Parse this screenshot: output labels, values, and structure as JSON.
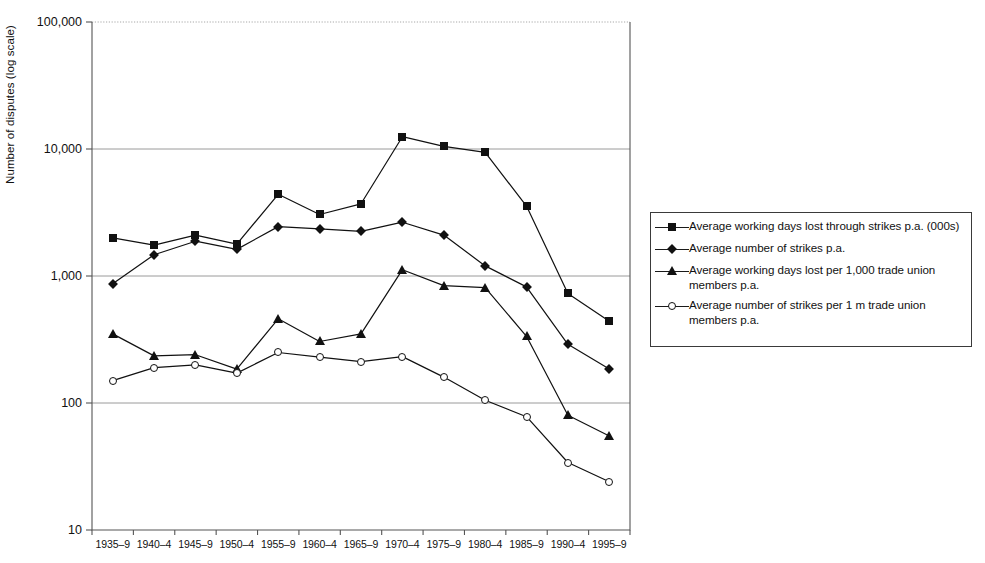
{
  "chart_data": {
    "type": "line",
    "title": "",
    "xlabel": "",
    "ylabel": "Number of disputes (log scale)",
    "log_scale": true,
    "ylim": [
      10,
      100000
    ],
    "ytick_values": [
      100000,
      10000,
      1000,
      100,
      10
    ],
    "ytick_labels": [
      "100,000",
      "10,000",
      "1,000",
      "100",
      "10"
    ],
    "grid": "horizontal-gridlines-at-y-ticks",
    "legend_position": "right-outside",
    "categories": [
      "1935–9",
      "1940–4",
      "1945–9",
      "1950–4",
      "1955–9",
      "1960–4",
      "1965–9",
      "1970–4",
      "1975–9",
      "1980–4",
      "1985–9",
      "1990–4",
      "1995–9"
    ],
    "series": [
      {
        "name": "Average working days lost through strikes p.a. (000s)",
        "marker": "filled-square",
        "values": [
          2000,
          1750,
          2100,
          1780,
          4400,
          3050,
          3700,
          12500,
          10500,
          9400,
          3550,
          730,
          440
        ]
      },
      {
        "name": "Average number of strikes p.a.",
        "marker": "filled-diamond",
        "values": [
          870,
          1470,
          1880,
          1620,
          2450,
          2350,
          2250,
          2650,
          2100,
          1200,
          820,
          290,
          185
        ]
      },
      {
        "name": "Average working days lost per 1,000 trade union members p.a.",
        "marker": "filled-triangle",
        "values": [
          350,
          235,
          240,
          185,
          460,
          305,
          350,
          1120,
          840,
          810,
          335,
          80,
          55
        ]
      },
      {
        "name": "Average number of strikes per 1 m trade union members p.a.",
        "marker": "open-circle",
        "values": [
          150,
          190,
          200,
          172,
          250,
          230,
          212,
          232,
          160,
          105,
          78,
          34,
          24
        ]
      }
    ]
  },
  "legend": {
    "entries": [
      {
        "marker": "filled-square",
        "label": "Average working days lost through strikes p.a. (000s)"
      },
      {
        "marker": "filled-diamond",
        "label": "Average number of strikes p.a."
      },
      {
        "marker": "filled-triangle",
        "label": "Average working days lost per 1,000 trade union members p.a."
      },
      {
        "marker": "open-circle",
        "label": "Average number of strikes per 1 m trade union members p.a."
      }
    ]
  },
  "colors": {
    "ink": "#111111",
    "gridline": "#9a9a9a",
    "axis": "#555555",
    "background": "#ffffff"
  }
}
